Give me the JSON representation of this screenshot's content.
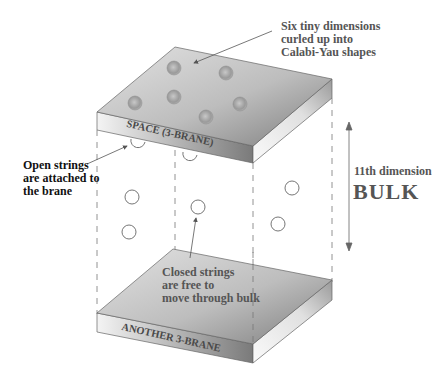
{
  "diagram": {
    "labels": {
      "calabi_yau": [
        "Six tiny dimensions",
        "curled up into",
        "Calabi-Yau shapes"
      ],
      "open_strings": [
        "Open strings",
        "are attached to",
        "the brane"
      ],
      "closed_strings": [
        "Closed strings",
        "are free to",
        "move through bulk"
      ],
      "eleventh_dimension": "11th dimension",
      "bulk": "BULK",
      "top_brane": "SPACE (3-BRANE)",
      "bottom_brane": "ANOTHER 3-BRANE"
    },
    "colors": {
      "slab_top_light": "#dcdcdc",
      "slab_top_dark": "#8c8c8c",
      "slab_front": "#a0a0a0",
      "slab_side": "#e8e8e8",
      "line": "#666666",
      "text": "#555555"
    },
    "elements": {
      "calabi_yau_spheres": 6,
      "open_string_loops": 2,
      "closed_string_loops": 5
    }
  }
}
